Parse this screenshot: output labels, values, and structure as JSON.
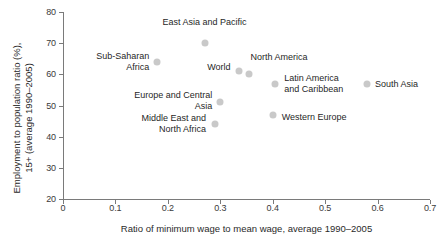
{
  "chart_data": {
    "type": "scatter",
    "title": "",
    "xlabel": "Ratio of minimum wage to mean wage, average 1990–2005",
    "ylabel_line1": "Employment to population ratio (%),",
    "ylabel_line2": "15+ (average 1990–2005)",
    "xlim": [
      0,
      0.7
    ],
    "ylim": [
      20,
      80
    ],
    "xticks": [
      "0",
      "0.1",
      "0.2",
      "0.3",
      "0.4",
      "0.5",
      "0.6",
      "0.7"
    ],
    "xtick_values": [
      0,
      0.1,
      0.2,
      0.3,
      0.4,
      0.5,
      0.6,
      0.7
    ],
    "yticks": [
      "20",
      "30",
      "40",
      "50",
      "60",
      "70",
      "80"
    ],
    "ytick_values": [
      20,
      30,
      40,
      50,
      60,
      70,
      80
    ],
    "grid": false,
    "legend": "none",
    "marker_color": "#c9c9c9",
    "axis_color": "#7a7a7a",
    "points": [
      {
        "name": "east-asia-and-pacific",
        "label_lines": [
          "East Asia and Pacific"
        ],
        "x": 0.27,
        "y": 70,
        "label_align": "center",
        "label_dx": 0,
        "label_dy": -21
      },
      {
        "name": "sub-saharan-africa",
        "label_lines": [
          "Sub-Saharan",
          "Africa"
        ],
        "x": 0.18,
        "y": 64,
        "label_align": "right",
        "label_dx": -8,
        "label_dy": 0
      },
      {
        "name": "world",
        "label_lines": [
          "World"
        ],
        "x": 0.335,
        "y": 61,
        "label_align": "right",
        "label_dx": -8,
        "label_dy": -4
      },
      {
        "name": "north-america",
        "label_lines": [
          "North America"
        ],
        "x": 0.355,
        "y": 60,
        "label_align": "center",
        "label_dx": 30,
        "label_dy": -17
      },
      {
        "name": "latin-america-and-caribbean",
        "label_lines": [
          "Latin America",
          "and Caribbean"
        ],
        "x": 0.405,
        "y": 57,
        "label_align": "left",
        "label_dx": 9,
        "label_dy": 0
      },
      {
        "name": "south-asia",
        "label_lines": [
          "South Asia"
        ],
        "x": 0.58,
        "y": 57,
        "label_align": "left",
        "label_dx": 8,
        "label_dy": 0
      },
      {
        "name": "europe-and-central-asia",
        "label_lines": [
          "Europe and Central",
          "Asia"
        ],
        "x": 0.3,
        "y": 51,
        "label_align": "right",
        "label_dx": -8,
        "label_dy": -1
      },
      {
        "name": "western-europe",
        "label_lines": [
          "Western Europe"
        ],
        "x": 0.4,
        "y": 47,
        "label_align": "left",
        "label_dx": 9,
        "label_dy": 2
      },
      {
        "name": "middle-east-and-north-africa",
        "label_lines": [
          "Middle East and",
          "North Africa"
        ],
        "x": 0.29,
        "y": 44,
        "label_align": "right",
        "label_dx": -9,
        "label_dy": 0
      }
    ]
  }
}
